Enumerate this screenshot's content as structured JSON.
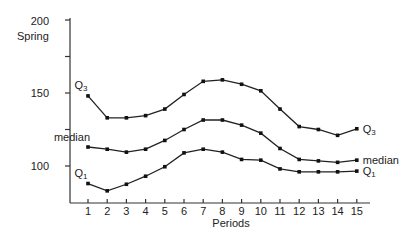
{
  "chart_data": {
    "type": "line",
    "title": "",
    "xlabel": "Periods",
    "ylabel": "Spring",
    "x": [
      1,
      2,
      3,
      4,
      5,
      6,
      7,
      8,
      9,
      10,
      11,
      12,
      13,
      14,
      15
    ],
    "xticks": [
      "1",
      "2",
      "3",
      "4",
      "5",
      "6",
      "7",
      "8",
      "9",
      "10",
      "11",
      "12",
      "13",
      "14",
      "15"
    ],
    "yticks": [
      100,
      150,
      200
    ],
    "yminor_ticks": [
      125,
      175
    ],
    "ylim": [
      75,
      200
    ],
    "grid": false,
    "legend": "inline labels at line ends",
    "series": [
      {
        "name": "Q3",
        "label_main": "Q",
        "label_sub": "3",
        "values": [
          148,
          133,
          133,
          134.5,
          139,
          149,
          158,
          159,
          156,
          151.5,
          139,
          127,
          125,
          121,
          125.5
        ]
      },
      {
        "name": "median",
        "label_main": "median",
        "label_sub": "",
        "values": [
          113,
          111.5,
          109.5,
          111.5,
          117.5,
          125,
          131.5,
          131.5,
          128,
          122.5,
          112,
          104.5,
          103.5,
          102.5,
          104
        ]
      },
      {
        "name": "Q1",
        "label_main": "Q",
        "label_sub": "1",
        "values": [
          88,
          83,
          87.5,
          93,
          99.5,
          109,
          111.5,
          109.5,
          104.5,
          104,
          98,
          96,
          96,
          96,
          96.5
        ]
      }
    ]
  },
  "labels": {
    "ylabel": "Spring",
    "xlabel": "Periods",
    "y200": "200",
    "y150": "150",
    "y100": "100"
  }
}
